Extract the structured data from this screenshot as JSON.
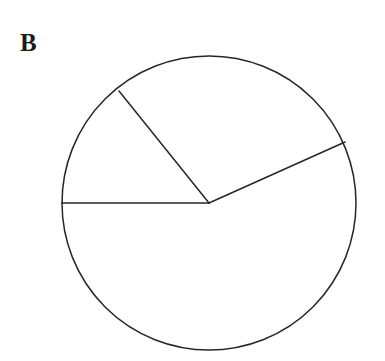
{
  "figure": {
    "label": "B",
    "background_color": "#ffffff",
    "stroke_color": "#262626",
    "fill_color": "#ffffff",
    "label_color": "#1a1a1a"
  },
  "chart_data": {
    "type": "pie",
    "title": "B",
    "xlabel": "",
    "ylabel": "",
    "legend": "none",
    "grid": false,
    "center": {
      "x": 209,
      "y": 203
    },
    "radius": 147,
    "line_width": 1.5,
    "categories": [
      "Small upper-left sector",
      "Upper sector",
      "Large lower sector"
    ],
    "values": [
      50.6,
      104.9,
      204.5
    ],
    "value_unit": "degrees",
    "fractions": [
      0.1406,
      0.2914,
      0.5681
    ],
    "colors": [
      "#ffffff",
      "#ffffff",
      "#ffffff"
    ],
    "radii_angles_deg": [
      180.0,
      129.4,
      24.5
    ],
    "radii_endpoints": [
      {
        "name": "left-horizontal-radius",
        "x": 62,
        "y": 203
      },
      {
        "name": "upper-left-radius",
        "x": 119,
        "y": 91
      },
      {
        "name": "upper-right-radius",
        "x": 345,
        "y": 142
      }
    ],
    "sectors": [
      {
        "name": "small-upper-left-sector",
        "start_deg": 129.4,
        "end_deg": 180.0,
        "sweep_deg": 50.6
      },
      {
        "name": "upper-sector",
        "start_deg": 24.5,
        "end_deg": 129.4,
        "sweep_deg": 104.9
      },
      {
        "name": "large-lower-sector",
        "start_deg": 180.0,
        "end_deg": 384.5,
        "sweep_deg": 204.5
      }
    ]
  }
}
